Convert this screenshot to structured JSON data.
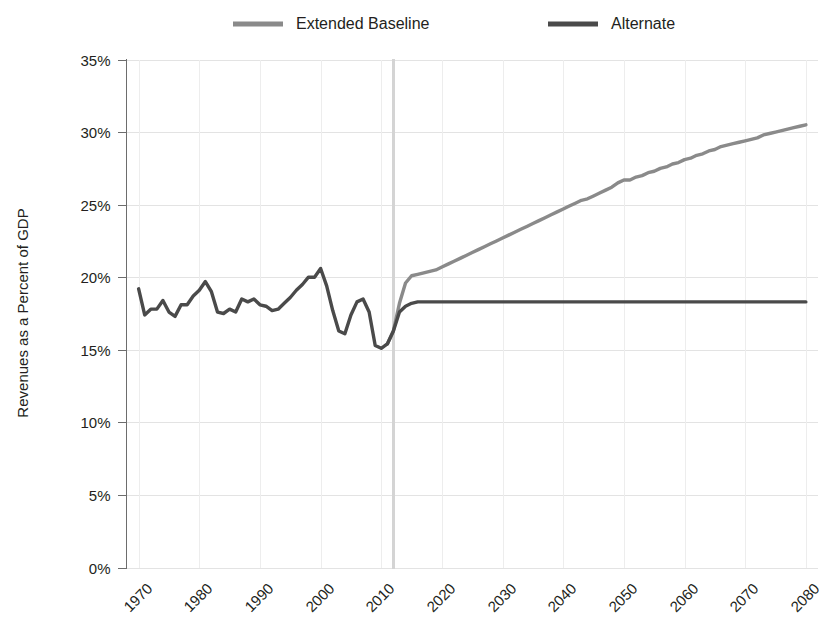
{
  "chart_data": {
    "type": "line",
    "title": "",
    "xlabel": "",
    "ylabel": "Revenues as a Percent of GDP",
    "xlim": [
      1968,
      2082
    ],
    "ylim": [
      0,
      35
    ],
    "grid": true,
    "legend_position": "top",
    "y_ticks": [
      0,
      5,
      10,
      15,
      20,
      25,
      30,
      35
    ],
    "y_tick_labels": [
      "0%",
      "5%",
      "10%",
      "15%",
      "20%",
      "25%",
      "30%",
      "35%"
    ],
    "x_ticks": [
      1970,
      1980,
      1990,
      2000,
      2010,
      2020,
      2030,
      2040,
      2050,
      2060,
      2070,
      2080
    ],
    "x_tick_labels": [
      "1970",
      "1980",
      "1990",
      "2000",
      "2010",
      "2020",
      "2030",
      "2040",
      "2050",
      "2060",
      "2070",
      "2080"
    ],
    "annotations": [
      {
        "name": "projection-divider",
        "type": "vline",
        "x": 2012,
        "color": "#d4d4d4"
      }
    ],
    "series": [
      {
        "name": "Extended Baseline",
        "color": "#8a8a8a",
        "width": 3.4,
        "x": [
          2011,
          2012,
          2013,
          2014,
          2015,
          2016,
          2017,
          2018,
          2019,
          2020,
          2021,
          2022,
          2023,
          2024,
          2025,
          2026,
          2027,
          2028,
          2029,
          2030,
          2031,
          2032,
          2033,
          2034,
          2035,
          2036,
          2037,
          2038,
          2039,
          2040,
          2041,
          2042,
          2043,
          2044,
          2045,
          2046,
          2047,
          2048,
          2049,
          2050,
          2051,
          2052,
          2053,
          2054,
          2055,
          2056,
          2057,
          2058,
          2059,
          2060,
          2061,
          2062,
          2063,
          2064,
          2065,
          2066,
          2067,
          2068,
          2069,
          2070,
          2071,
          2072,
          2073,
          2074,
          2075,
          2076,
          2077,
          2078,
          2079,
          2080
        ],
        "values": [
          15.4,
          16.3,
          18.2,
          19.6,
          20.1,
          20.2,
          20.3,
          20.4,
          20.5,
          20.7,
          20.9,
          21.1,
          21.3,
          21.5,
          21.7,
          21.9,
          22.1,
          22.3,
          22.5,
          22.7,
          22.9,
          23.1,
          23.3,
          23.5,
          23.7,
          23.9,
          24.1,
          24.3,
          24.5,
          24.7,
          24.9,
          25.1,
          25.3,
          25.4,
          25.6,
          25.8,
          26.0,
          26.2,
          26.5,
          26.7,
          26.7,
          26.9,
          27.0,
          27.2,
          27.3,
          27.5,
          27.6,
          27.8,
          27.9,
          28.1,
          28.2,
          28.4,
          28.5,
          28.7,
          28.8,
          29.0,
          29.1,
          29.2,
          29.3,
          29.4,
          29.5,
          29.6,
          29.8,
          29.9,
          30.0,
          30.1,
          30.2,
          30.3,
          30.4,
          30.5
        ]
      },
      {
        "name": "Alternate",
        "color": "#4a4a4a",
        "width": 3.4,
        "x": [
          1970,
          1971,
          1972,
          1973,
          1974,
          1975,
          1976,
          1977,
          1978,
          1979,
          1980,
          1981,
          1982,
          1983,
          1984,
          1985,
          1986,
          1987,
          1988,
          1989,
          1990,
          1991,
          1992,
          1993,
          1994,
          1995,
          1996,
          1997,
          1998,
          1999,
          2000,
          2001,
          2002,
          2003,
          2004,
          2005,
          2006,
          2007,
          2008,
          2009,
          2010,
          2011,
          2012,
          2013,
          2014,
          2015,
          2016,
          2017,
          2018,
          2019,
          2020,
          2030,
          2040,
          2050,
          2060,
          2070,
          2080
        ],
        "values": [
          19.2,
          17.4,
          17.8,
          17.8,
          18.4,
          17.6,
          17.3,
          18.1,
          18.1,
          18.7,
          19.1,
          19.7,
          19.0,
          17.6,
          17.5,
          17.8,
          17.6,
          18.5,
          18.3,
          18.5,
          18.1,
          18.0,
          17.7,
          17.8,
          18.2,
          18.6,
          19.1,
          19.5,
          20.0,
          20.0,
          20.6,
          19.4,
          17.7,
          16.3,
          16.1,
          17.4,
          18.3,
          18.5,
          17.6,
          15.3,
          15.1,
          15.4,
          16.3,
          17.6,
          18.0,
          18.2,
          18.3,
          18.3,
          18.3,
          18.3,
          18.3,
          18.3,
          18.3,
          18.3,
          18.3,
          18.3,
          18.3
        ]
      }
    ],
    "legend": [
      {
        "label": "Extended Baseline",
        "color": "#8a8a8a"
      },
      {
        "label": "Alternate",
        "color": "#4a4a4a"
      }
    ]
  }
}
